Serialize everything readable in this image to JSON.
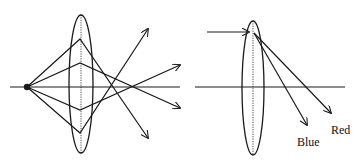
{
  "diagrams": [
    {
      "id": "left",
      "description": "Point source on the optical axis; rays pass through a converging lens and cross after the lens",
      "axis": {
        "x1": 10,
        "x2": 180,
        "y": 87
      },
      "source_point": {
        "x": 27,
        "y": 87
      },
      "lens": {
        "cx": 81,
        "cy": 84,
        "rx": 12,
        "ry": 69
      },
      "rays": [
        {
          "points": [
            [
              27,
              87
            ],
            [
              80,
              39
            ],
            [
              148,
              138
            ]
          ],
          "arrow": true
        },
        {
          "points": [
            [
              27,
              87
            ],
            [
              80,
              63
            ],
            [
              180,
              108
            ]
          ],
          "arrow": true
        },
        {
          "points": [
            [
              27,
              87
            ],
            [
              80,
              110
            ],
            [
              180,
              65
            ]
          ],
          "arrow": true
        },
        {
          "points": [
            [
              27,
              87
            ],
            [
              80,
              133
            ],
            [
              148,
              29
            ]
          ],
          "arrow": true
        }
      ]
    },
    {
      "id": "right",
      "description": "Parallel incoming ray hits lens; dispersion splits it into blue and red rays",
      "axis": {
        "x1": 195,
        "x2": 345,
        "y": 87
      },
      "lens": {
        "cx": 253,
        "cy": 88,
        "rx": 11,
        "ry": 67
      },
      "incoming_ray": {
        "x1": 207,
        "y1": 32,
        "x2": 249,
        "y2": 32
      },
      "rays": [
        {
          "name": "Blue",
          "points": [
            [
              254,
              33
            ],
            [
              307,
              125
            ]
          ],
          "arrow": true
        },
        {
          "name": "Red",
          "points": [
            [
              254,
              33
            ],
            [
              331,
              113
            ]
          ],
          "arrow": true
        }
      ],
      "labels": [
        {
          "text": "Blue",
          "x": 297,
          "y": 136
        },
        {
          "text": "Red",
          "x": 331,
          "y": 124
        }
      ]
    }
  ],
  "colors": {
    "stroke": "#1a1a1a",
    "background": "#ffffff"
  }
}
